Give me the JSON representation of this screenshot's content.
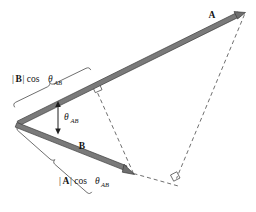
{
  "figure": {
    "background_color": "#ffffff",
    "vector_color": "#7a7a7a",
    "line_color": "#4a4a4a",
    "text_color": "#141414",
    "labels": {
      "vector_a": "A",
      "vector_b": "B",
      "angle": "θ",
      "angle_sub": "AB",
      "proj_b_prefix": "|",
      "proj_b_vector": "B",
      "proj_b_suffix": "| cos",
      "proj_b_theta": "θ",
      "proj_b_sub": "AB",
      "proj_a_prefix": "|",
      "proj_a_vector": "A",
      "proj_a_suffix": "| cos",
      "proj_a_theta": "θ",
      "proj_a_sub": "AB"
    },
    "geometry": {
      "origin": [
        18,
        124
      ],
      "a_tip": [
        245,
        13
      ],
      "b_tip": [
        133,
        174
      ],
      "a_foot_of_perp": [
        97,
        90
      ],
      "b_extended_foot": [
        176,
        178
      ],
      "a_vector_label_pos": [
        213,
        15
      ],
      "b_vector_label_pos": [
        82,
        146
      ]
    },
    "elements": {
      "right_angle_upper": "right-angle-marker-on-vector-a",
      "right_angle_lower": "right-angle-marker-on-vector-b-extension",
      "dashed_perp_a": "perpendicular-from-b-tip-to-vector-a",
      "dashed_perp_b": "perpendicular-from-a-tip-to-vector-b-line",
      "brace_upper": "brace-for-b-projection",
      "brace_lower": "brace-for-a-projection",
      "angle_indicator": "double-headed-arrow-between-vectors"
    }
  }
}
